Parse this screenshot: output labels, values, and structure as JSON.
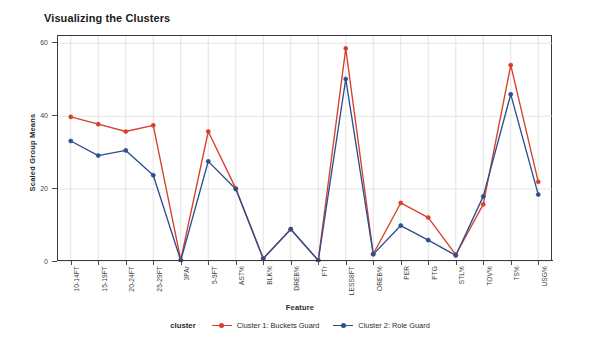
{
  "chart_data": {
    "type": "line",
    "title": "Visualizing the Clusters",
    "xlabel": "Feature",
    "ylabel": "Scaled Group Means",
    "ylim": [
      0,
      62
    ],
    "yticks": [
      0,
      20,
      40,
      60
    ],
    "grid": true,
    "legend_position": "bottom",
    "legend_title": "cluster",
    "categories": [
      "10-14FT",
      "15-19FT",
      "20-24FT",
      "25-29FT",
      "3PAr",
      "5-9FT",
      "AST%",
      "BLK%",
      "DREB%",
      "FTr",
      "LESS8FT",
      "OREB%",
      "PER",
      "PTG",
      "STL%",
      "TOV%",
      "TS%",
      "USG%"
    ],
    "series": [
      {
        "name": "Cluster 1: Buckets Guard",
        "color": "#d6402c",
        "values": [
          39.8,
          37.8,
          35.8,
          37.5,
          0.6,
          35.8,
          20.2,
          1.0,
          9.0,
          0.5,
          58.6,
          2.2,
          16.2,
          12.2,
          2.0,
          15.8,
          54.0,
          22.0
        ]
      },
      {
        "name": "Cluster 2: Role Guard",
        "color": "#2b4f8e",
        "values": [
          33.2,
          29.2,
          30.6,
          23.8,
          0.4,
          27.6,
          20.0,
          0.9,
          9.0,
          0.4,
          50.2,
          2.1,
          10.0,
          6.0,
          1.8,
          18.0,
          46.0,
          18.5
        ]
      }
    ]
  }
}
